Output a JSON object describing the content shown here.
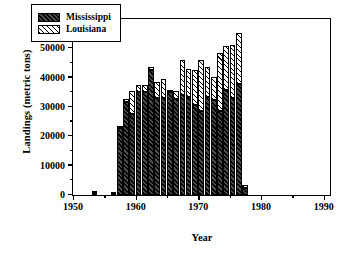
{
  "chart_data": {
    "type": "bar",
    "subtype": "stacked",
    "title": "",
    "xlabel": "Year",
    "ylabel": "Landings (metric tons)",
    "xlim": [
      1950,
      1991
    ],
    "ylim": [
      0,
      60000
    ],
    "ytick_labels": [
      "0",
      "10000",
      "20000",
      "30000",
      "40000",
      "50000",
      "60000"
    ],
    "ytick_values": [
      0,
      10000,
      20000,
      30000,
      40000,
      50000,
      60000
    ],
    "ytick_minor_step": 5000,
    "xtick_labels": [
      "1950",
      "1960",
      "1970",
      "1980",
      "1990"
    ],
    "xtick_values": [
      1950,
      1960,
      1970,
      1980,
      1990
    ],
    "xtick_minor_step": 5,
    "grid": false,
    "legend_position": "top-left-inside",
    "categories": [
      1950,
      1951,
      1952,
      1953,
      1954,
      1955,
      1956,
      1957,
      1958,
      1959,
      1960,
      1961,
      1962,
      1963,
      1964,
      1965,
      1966,
      1967,
      1968,
      1969,
      1970,
      1971,
      1972,
      1973,
      1974,
      1975,
      1976,
      1977
    ],
    "series": [
      {
        "name": "Mississippi",
        "color": "#2b2b2b",
        "pattern": "dark-hatch",
        "values": [
          0,
          0,
          0,
          700,
          0,
          0,
          300,
          22800,
          31800,
          27600,
          35100,
          35000,
          42500,
          33000,
          33000,
          35200,
          32800,
          34200,
          33500,
          30600,
          28600,
          33500,
          32300,
          28600,
          35800,
          33100,
          37900,
          2400
        ]
      },
      {
        "name": "Louisiana",
        "color": "#ffffff",
        "pattern": "light-hatch",
        "values": [
          0,
          0,
          0,
          200,
          0,
          0,
          200,
          200,
          1100,
          8000,
          2400,
          2500,
          1100,
          5600,
          6700,
          600,
          2800,
          11700,
          9500,
          12100,
          17300,
          10100,
          7800,
          19700,
          15000,
          18100,
          17400,
          1100
        ]
      }
    ]
  },
  "legend": {
    "entries": [
      {
        "label": "Mississippi",
        "swatch": "ms"
      },
      {
        "label": "Louisiana",
        "swatch": "la"
      }
    ]
  }
}
